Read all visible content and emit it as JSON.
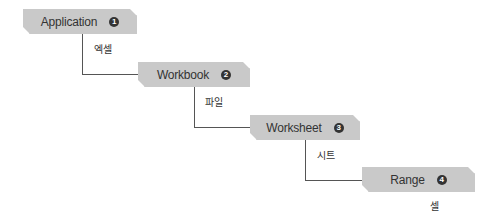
{
  "diagram": {
    "type": "object-hierarchy",
    "nodes": [
      {
        "label": "Application",
        "number": "1",
        "sublabel": "엑셀"
      },
      {
        "label": "Workbook",
        "number": "2",
        "sublabel": "파일"
      },
      {
        "label": "Worksheet",
        "number": "3",
        "sublabel": "시트"
      },
      {
        "label": "Range",
        "number": "4",
        "sublabel": "셀"
      }
    ],
    "edges": [
      {
        "from": "Application",
        "to": "Workbook"
      },
      {
        "from": "Workbook",
        "to": "Worksheet"
      },
      {
        "from": "Worksheet",
        "to": "Range"
      }
    ],
    "colors": {
      "node_fill": "#c9c9c9",
      "badge": "#333333",
      "line": "#555555",
      "text": "#333333"
    }
  }
}
